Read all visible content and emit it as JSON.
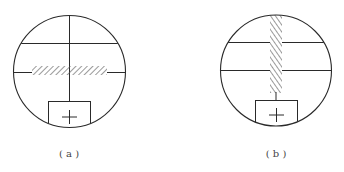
{
  "figures": [
    {
      "id": "a",
      "caption": "( a )",
      "description": "Reticle view with horizontal hatched bar across middle crosshair",
      "circle": {
        "cx": 69.5,
        "cy": 71.5,
        "r": 56
      },
      "hatch_orientation": "horizontal"
    },
    {
      "id": "b",
      "caption": "( b )",
      "description": "Reticle view with vertical hatched bar along vertical crosshair",
      "circle": {
        "cx": 276,
        "cy": 70.5,
        "r": 55.5
      },
      "hatch_orientation": "vertical"
    }
  ],
  "colors": {
    "stroke": "#2a2a2a",
    "hatch": "#555555",
    "caption": "#444444",
    "background": "#ffffff"
  }
}
